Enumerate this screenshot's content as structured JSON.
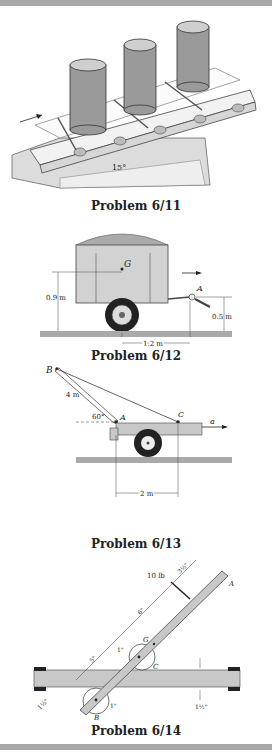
{
  "figures": [
    {
      "id": "6/11",
      "caption": "Problem 6/11",
      "labels": {
        "angle": "15°"
      }
    },
    {
      "id": "6/12",
      "caption": "Problem 6/12",
      "labels": {
        "cg": "G",
        "hitch": "A",
        "height_cg": "0.9 m",
        "height_hitch": "0.5 m",
        "distance": "1.2 m"
      }
    },
    {
      "id": "6/13",
      "caption": "Problem 6/13",
      "labels": {
        "top": "B",
        "pin": "A",
        "attach": "C",
        "boom_length": "4 m",
        "angle": "60°",
        "accel": "a",
        "distance": "2 m"
      }
    },
    {
      "id": "6/14",
      "caption": "Problem 6/14",
      "labels": {
        "force": "10 lb",
        "end": "A",
        "cg": "G",
        "contact_c": "C",
        "contact_b": "B",
        "d1": "3½\"",
        "d2": "6\"",
        "d3": "5\"",
        "r1": "1\"",
        "r2": "1\"",
        "w1": "1½\"",
        "w2": "1½\""
      }
    }
  ],
  "colors": {
    "frame_bar": "#a9a9a9",
    "fill_gray": "#c8c8c8",
    "ink": "#222222"
  }
}
